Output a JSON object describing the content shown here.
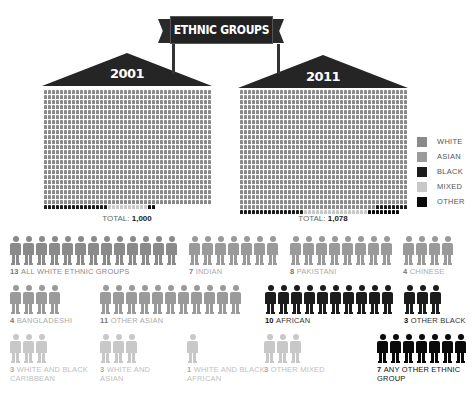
{
  "title": "ETHNIC GROUPS",
  "colors": {
    "white": "#8a8a8a",
    "asian": "#9a9a9a",
    "black": "#1c1c1c",
    "mixed": "#c8c8c8",
    "other": "#0a0a0a"
  },
  "houses": [
    {
      "year": "2001",
      "total_label": "TOTAL:",
      "total_value": "1,000"
    },
    {
      "year": "2011",
      "total_label": "TOTAL:",
      "total_value": "1,078"
    }
  ],
  "legend": [
    {
      "key": "white",
      "label": "WHITE"
    },
    {
      "key": "asian",
      "label": "ASIAN"
    },
    {
      "key": "black",
      "label": "BLACK"
    },
    {
      "key": "mixed",
      "label": "MIXED"
    },
    {
      "key": "other",
      "label": "OTHER"
    }
  ],
  "groups": [
    {
      "count": "13",
      "label": "ALL WHITE ETHNIC GROUPS",
      "category": "white"
    },
    {
      "count": "7",
      "label": "INDIAN",
      "category": "asian"
    },
    {
      "count": "8",
      "label": "PAKISTANI",
      "category": "asian"
    },
    {
      "count": "4",
      "label": "CHINESE",
      "category": "asian"
    },
    {
      "count": "4",
      "label": "BANGLADESHI",
      "category": "asian"
    },
    {
      "count": "11",
      "label": "OTHER ASIAN",
      "category": "asian"
    },
    {
      "count": "10",
      "label": "AFRICAN",
      "category": "black"
    },
    {
      "count": "3",
      "label": "OTHER BLACK",
      "category": "black"
    },
    {
      "count": "3",
      "label": "WHITE AND BLACK CARIBBEAN",
      "category": "mixed"
    },
    {
      "count": "3",
      "label": "WHITE AND ASIAN",
      "category": "mixed"
    },
    {
      "count": "1",
      "label": "WHITE AND BLACK AFRICAN",
      "category": "mixed"
    },
    {
      "count": "3",
      "label": "OTHER MIXED",
      "category": "mixed"
    },
    {
      "count": "7",
      "label": "ANY OTHER ETHNIC GROUP",
      "category": "other"
    }
  ]
}
